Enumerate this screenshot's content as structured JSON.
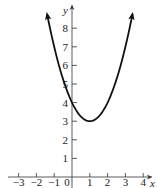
{
  "chart_data": {
    "type": "line",
    "title": "",
    "xlabel": "x",
    "ylabel": "y",
    "function": "y = (x - 1)^2 + 3",
    "xlim": [
      -3.5,
      4.5
    ],
    "ylim": [
      0,
      9
    ],
    "x_ticks": [
      -3,
      -2,
      -1,
      0,
      1,
      2,
      3,
      4
    ],
    "x_tick_labels": [
      "−3",
      "−2",
      "−1",
      "0",
      "1",
      "2",
      "3",
      "4"
    ],
    "y_ticks": [
      1,
      2,
      3,
      4,
      5,
      6,
      7,
      8
    ],
    "y_tick_labels": [
      "1",
      "2",
      "3",
      "4",
      "5",
      "6",
      "7",
      "8"
    ],
    "grid": false,
    "legend": null,
    "vertex": [
      1,
      3
    ],
    "y_intercept": [
      0,
      4
    ],
    "curve_x_range": [
      -1.4,
      3.4
    ],
    "series": [
      {
        "name": "parabola",
        "x": [
          -1.4,
          -1,
          -0.5,
          0,
          0.5,
          1,
          1.5,
          2,
          2.5,
          3,
          3.4
        ],
        "y": [
          8.76,
          7,
          5.25,
          4,
          3.25,
          3,
          3.25,
          4,
          5.25,
          7,
          8.76
        ]
      }
    ],
    "color": "#111111"
  }
}
